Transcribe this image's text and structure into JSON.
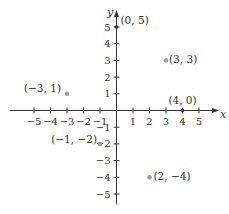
{
  "chart_data": {
    "type": "scatter",
    "title": "",
    "xlabel": "x",
    "ylabel": "y",
    "xlim": [
      -6,
      6
    ],
    "ylim": [
      -6,
      6
    ],
    "grid": false,
    "x_ticks": [
      -5,
      -4,
      -3,
      -2,
      -1,
      1,
      2,
      3,
      4,
      5
    ],
    "y_ticks": [
      -5,
      -4,
      -3,
      -2,
      -1,
      1,
      2,
      3,
      4,
      5
    ],
    "x_tick_labels": [
      "−5",
      "−4",
      "−3",
      "−2",
      "−1",
      "1",
      "2",
      "3",
      "4",
      "5"
    ],
    "y_tick_labels": [
      "−5",
      "−4",
      "−3",
      "−2",
      "−1",
      "1",
      "2",
      "3",
      "4",
      "5"
    ],
    "points": [
      {
        "x": 0,
        "y": 5,
        "label": "(0, 5)"
      },
      {
        "x": 3,
        "y": 3,
        "label": "(3, 3)"
      },
      {
        "x": -3,
        "y": 1,
        "label": "(−3, 1)"
      },
      {
        "x": 4,
        "y": 0,
        "label": "(4, 0)"
      },
      {
        "x": -1,
        "y": -2,
        "label": "(−1, −2)"
      },
      {
        "x": 2,
        "y": -4,
        "label": "(2, −4)"
      }
    ]
  },
  "axes": {
    "x_name": "x",
    "y_name": "y"
  },
  "colors": {
    "axis": "#333333",
    "point": "#9a9a9a",
    "text": "#333333"
  }
}
